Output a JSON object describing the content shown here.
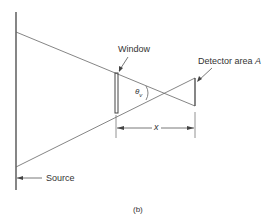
{
  "labels": {
    "window": "Window",
    "detector": "Detector area ",
    "detector_var": "A",
    "theta": "θ",
    "theta_sub": "v",
    "distance": "x",
    "source": "Source",
    "caption": "(b)"
  },
  "colors": {
    "line": "#555555",
    "text": "#333333"
  }
}
